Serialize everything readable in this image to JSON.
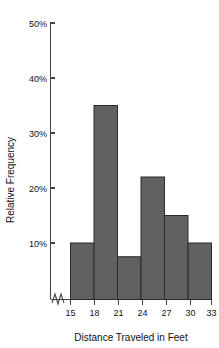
{
  "chart_data": {
    "type": "bar",
    "title": "",
    "subtitle": "",
    "xlabel": "Distance Traveled in Feet",
    "ylabel": "Relative Frequency",
    "categories": [
      "15-18",
      "18-21",
      "21-24",
      "24-27",
      "27-30",
      "30-33"
    ],
    "bin_edges": [
      15,
      18,
      21,
      24,
      27,
      30,
      33
    ],
    "values": [
      10,
      35,
      7.5,
      22,
      15,
      10
    ],
    "value_unit": "%",
    "xlim": [
      15,
      33
    ],
    "ylim": [
      0,
      50
    ],
    "xticks": [
      "15",
      "18",
      "21",
      "24",
      "27",
      "30",
      "33"
    ],
    "xtick_values": [
      15,
      18,
      21,
      24,
      27,
      30,
      33
    ],
    "yticks": [
      "10%",
      "20%",
      "30%",
      "40%",
      "50%"
    ],
    "ytick_values": [
      10,
      20,
      30,
      40,
      50
    ],
    "grid": false,
    "legend": null,
    "axis_break": true,
    "axis_break_axis": "y",
    "bar_color": "#616161",
    "bar_edge_color": "#2a2a2a",
    "axis_color": "#444444",
    "text_color": "#111111",
    "background_color": "#ffffff"
  }
}
